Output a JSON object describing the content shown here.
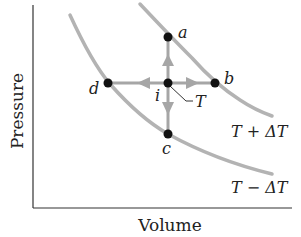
{
  "diagram": {
    "axes": {
      "y_label": "Pressure",
      "x_label": "Volume"
    },
    "isotherms": [
      {
        "id": "upper",
        "label": "T + ΔT"
      },
      {
        "id": "lower",
        "label": "T − ΔT"
      }
    ],
    "points": {
      "a": "a",
      "b": "b",
      "c": "c",
      "d": "d",
      "i": "i"
    },
    "callout": "T",
    "colors": {
      "curve": "#b3b3b3",
      "arrow": "#a6a6a6",
      "point": "#111111",
      "axis": "#333333"
    }
  }
}
